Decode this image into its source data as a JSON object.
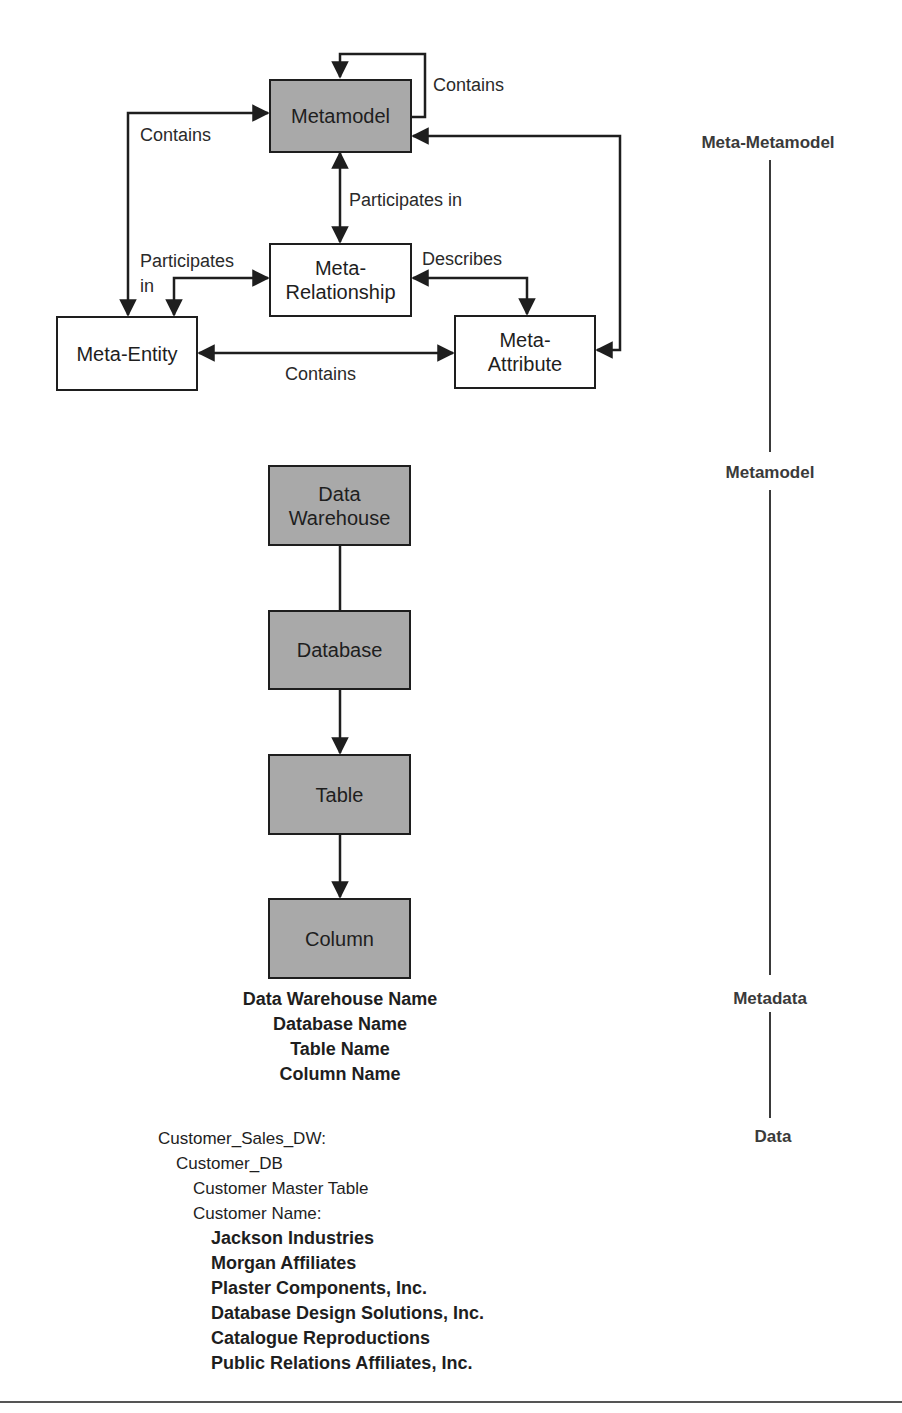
{
  "diagram": {
    "boxes": {
      "metamodel": "Metamodel",
      "meta_relationship": "Meta-\nRelationship",
      "meta_entity": "Meta-Entity",
      "meta_attribute": "Meta-\nAttribute",
      "data_warehouse": "Data\nWarehouse",
      "database": "Database",
      "table": "Table",
      "column": "Column"
    },
    "edge_labels": {
      "self_contains": "Contains",
      "left_contains": "Contains",
      "participates_in_vertical": "Participates in",
      "participates_in_left_line1": "Participates",
      "participates_in_left_line2": "in",
      "describes": "Describes",
      "bottom_contains": "Contains"
    },
    "levels": [
      "Meta-Metamodel",
      "Metamodel",
      "Metadata",
      "Data"
    ],
    "metadata_names": [
      "Data Warehouse Name",
      "Database Name",
      "Table Name",
      "Column Name"
    ],
    "data_example": {
      "warehouse": "Customer_Sales_DW:",
      "database": "Customer_DB",
      "table": "Customer Master Table",
      "column": "Customer Name:",
      "values": [
        "Jackson Industries",
        "Morgan Affiliates",
        "Plaster Components, Inc.",
        "Database Design Solutions, Inc.",
        "Catalogue Reproductions",
        "Public Relations Affiliates, Inc."
      ]
    },
    "colors": {
      "shaded_fill": "#a9a9a9",
      "stroke": "#1e1e1e"
    }
  }
}
